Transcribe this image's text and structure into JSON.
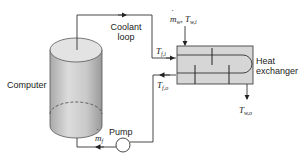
{
  "diagram": {
    "components": {
      "computer": {
        "label": "Computer"
      },
      "coolant_loop": {
        "label_line1": "Coolant",
        "label_line2": "loop"
      },
      "heat_exchanger": {
        "label_line1": "Heat",
        "label_line2": "exchanger"
      },
      "pump": {
        "label": "Pump"
      }
    },
    "symbols": {
      "water_inlet_mass": {
        "base": "m",
        "sub": "w"
      },
      "water_inlet_temp": {
        "base": "T",
        "sub": "w,i"
      },
      "water_outlet_temp": {
        "base": "T",
        "sub": "w,o"
      },
      "fluid_inlet_temp": {
        "base": "T",
        "sub": "f,i"
      },
      "fluid_outlet_temp": {
        "base": "T",
        "sub": "f,o"
      },
      "fluid_mass_flow": {
        "base": "m",
        "sub": "f"
      }
    },
    "colors": {
      "line": "#333333",
      "cylinder_fill": "#c8c8c8",
      "cylinder_top": "#e2e2e2",
      "hx_fill": "#d4d4d4"
    }
  }
}
